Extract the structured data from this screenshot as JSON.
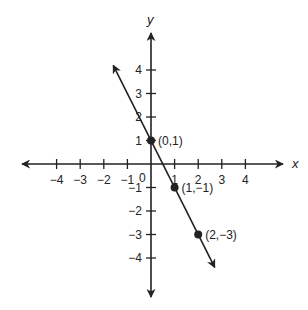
{
  "chart_data": {
    "type": "line",
    "title": "",
    "xlabel": "x",
    "ylabel": "y",
    "xlim": [
      -4.5,
      5.5
    ],
    "ylim": [
      -5.6,
      5.6
    ],
    "grid": false,
    "x_ticks": [
      -4,
      -3,
      -2,
      -1,
      1,
      2,
      3,
      4
    ],
    "y_ticks": [
      4,
      3,
      2,
      1,
      -1,
      -2,
      -3,
      -4
    ],
    "origin_label": "0",
    "x_tick_labels": [
      "−4",
      "−3",
      "−2",
      "−1",
      "1",
      "2",
      "3",
      "4"
    ],
    "y_tick_labels": [
      "4",
      "3",
      "2",
      "1",
      "−1",
      "−2",
      "−3",
      "−4"
    ],
    "series": [
      {
        "name": "line y = -2x + 1",
        "slope": -2,
        "intercept": 1,
        "endpoints": [
          [
            -1.6,
            4.2
          ],
          [
            2.7,
            -4.4
          ]
        ],
        "points": [
          {
            "x": 0,
            "y": 1,
            "label": "(0,1)"
          },
          {
            "x": 1,
            "y": -1,
            "label": "(1,−1)"
          },
          {
            "x": 2,
            "y": -3,
            "label": "(2,−3)"
          }
        ]
      }
    ]
  },
  "colors": {
    "ink": "#222222",
    "background": "#ffffff"
  }
}
